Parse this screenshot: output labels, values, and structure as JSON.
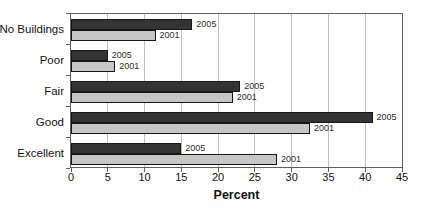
{
  "chart_data": {
    "type": "bar",
    "orientation": "horizontal",
    "title": "",
    "xlabel": "Percent",
    "ylabel": "",
    "xlim": [
      0,
      45
    ],
    "xticks": [
      0,
      5,
      10,
      15,
      20,
      25,
      30,
      35,
      40,
      45
    ],
    "grid": "vertical",
    "legend_position": "labels at bar ends",
    "categories": [
      "No Buildings",
      "Poor",
      "Fair",
      "Good",
      "Excellent"
    ],
    "series": [
      {
        "name": "2005",
        "color": "#343434",
        "values": [
          16.5,
          5,
          23,
          41,
          15
        ]
      },
      {
        "name": "2001",
        "color": "#c6c6c6",
        "values": [
          11.5,
          6,
          22,
          32.5,
          28
        ]
      }
    ]
  },
  "colors": {
    "background": "#ffffff",
    "plot_border": "#5f5f5f",
    "gridline": "#bdbdbd",
    "bar_border": "#161616",
    "text": "#111111",
    "bar_label_text": "#2b2b2b"
  }
}
